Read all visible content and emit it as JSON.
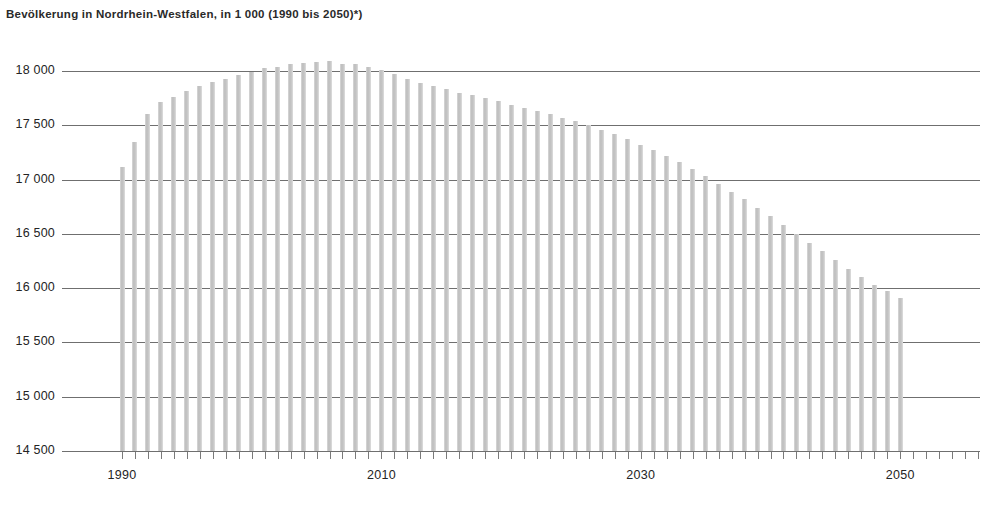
{
  "chart_data": {
    "type": "bar",
    "title": "Bevölkerung in Nordrhein-Westfalen, in 1 000 (1990 bis 2050)*)",
    "xlabel": "",
    "ylabel": "",
    "ylim": [
      14500,
      18000
    ],
    "ytick_step": 500,
    "grid": true,
    "legend": null,
    "ytick_labels": [
      "18 000",
      "17 500",
      "17 000",
      "16 500",
      "16 000",
      "15 500",
      "15 000",
      "14 500"
    ],
    "ytick_values": [
      18000,
      17500,
      17000,
      16500,
      16000,
      15500,
      15000,
      14500
    ],
    "xtick_labels": [
      "1990",
      "2010",
      "2030",
      "2050"
    ],
    "xtick_values": [
      1990,
      2010,
      2030,
      2050
    ],
    "bar_color": "#c8c8c8",
    "axis_color": "#6f6f6f",
    "categories": [
      1990,
      1991,
      1992,
      1993,
      1994,
      1995,
      1996,
      1997,
      1998,
      1999,
      2000,
      2001,
      2002,
      2003,
      2004,
      2005,
      2006,
      2007,
      2008,
      2009,
      2010,
      2011,
      2012,
      2013,
      2014,
      2015,
      2016,
      2017,
      2018,
      2019,
      2020,
      2021,
      2022,
      2023,
      2024,
      2025,
      2026,
      2027,
      2028,
      2029,
      2030,
      2031,
      2032,
      2033,
      2034,
      2035,
      2036,
      2037,
      2038,
      2039,
      2040,
      2041,
      2042,
      2043,
      2044,
      2045,
      2046,
      2047,
      2048,
      2049,
      2050
    ],
    "values": [
      17120,
      17350,
      17600,
      17710,
      17760,
      17820,
      17860,
      17900,
      17930,
      17960,
      17990,
      18030,
      18040,
      18060,
      18070,
      18080,
      18090,
      18060,
      18060,
      18040,
      18010,
      17970,
      17930,
      17890,
      17860,
      17830,
      17800,
      17780,
      17750,
      17720,
      17690,
      17660,
      17630,
      17600,
      17570,
      17540,
      17500,
      17460,
      17420,
      17370,
      17320,
      17270,
      17220,
      17160,
      17100,
      17030,
      16960,
      16890,
      16820,
      16740,
      16660,
      16580,
      16500,
      16420,
      16340,
      16260,
      16180,
      16100,
      16030,
      15970,
      15910
    ]
  },
  "footnote": ""
}
